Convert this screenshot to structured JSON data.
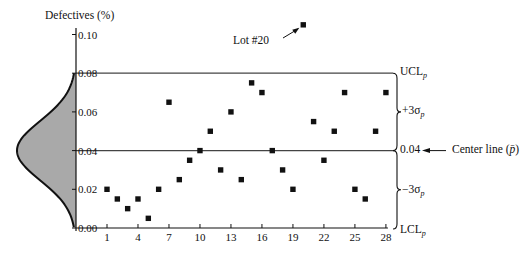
{
  "chart_data": {
    "type": "scatter",
    "title": "",
    "xlabel": "",
    "ylabel": "Defectives (%)",
    "xlim": [
      1,
      28
    ],
    "ylim": [
      0.0,
      0.1
    ],
    "x_ticks": [
      1,
      4,
      7,
      10,
      13,
      16,
      19,
      22,
      25,
      28
    ],
    "y_ticks": [
      "0.00",
      "0.02",
      "0.04",
      "0.06",
      "0.08",
      "0.10"
    ],
    "grid": false,
    "series": [
      {
        "name": "Lot defect proportion",
        "x": [
          1,
          2,
          3,
          4,
          5,
          6,
          7,
          8,
          9,
          10,
          11,
          12,
          13,
          14,
          15,
          16,
          17,
          18,
          19,
          20,
          21,
          22,
          23,
          24,
          25,
          26,
          27,
          28
        ],
        "values": [
          0.02,
          0.015,
          0.01,
          0.015,
          0.005,
          0.02,
          0.065,
          0.025,
          0.035,
          0.04,
          0.05,
          0.03,
          0.06,
          0.025,
          0.075,
          0.07,
          0.04,
          0.03,
          0.02,
          0.105,
          0.055,
          0.035,
          0.05,
          0.07,
          0.02,
          0.015,
          0.05,
          0.07
        ]
      }
    ],
    "reference_lines": [
      {
        "name": "UCL",
        "value": 0.08,
        "label": "UCL",
        "subscript": "p"
      },
      {
        "name": "Center line",
        "value": 0.04,
        "label": "0.04"
      },
      {
        "name": "LCL",
        "value": 0.0,
        "label": "LCL",
        "subscript": "p"
      }
    ],
    "annotations": [
      {
        "text": "Lot #20",
        "target_x": 20,
        "target_y": 0.105
      },
      {
        "text": "Center line (p̄)",
        "target_value": 0.04
      },
      {
        "text": "+3σ",
        "subscript": "p",
        "span": [
          0.04,
          0.08
        ]
      },
      {
        "text": "−3σ",
        "subscript": "p",
        "span": [
          0.0,
          0.04
        ]
      }
    ],
    "distribution_overlay": {
      "type": "normal",
      "mean": 0.04,
      "range": [
        0.0,
        0.08
      ],
      "fill": "#a9a9a9"
    }
  },
  "labels": {
    "ylabel": "Defectives (%)",
    "lot20": "Lot #20",
    "ucl": "UCL",
    "lcl": "LCL",
    "sub_p": "p",
    "plus3sigma": "+3σ",
    "minus3sigma": "−3σ",
    "center_value": "0.04",
    "center_text": "Center line (",
    "pbar": "p̄",
    "center_close": ")"
  },
  "colors": {
    "ink": "#111111",
    "line": "#444444",
    "fill": "#a9a9a9"
  }
}
